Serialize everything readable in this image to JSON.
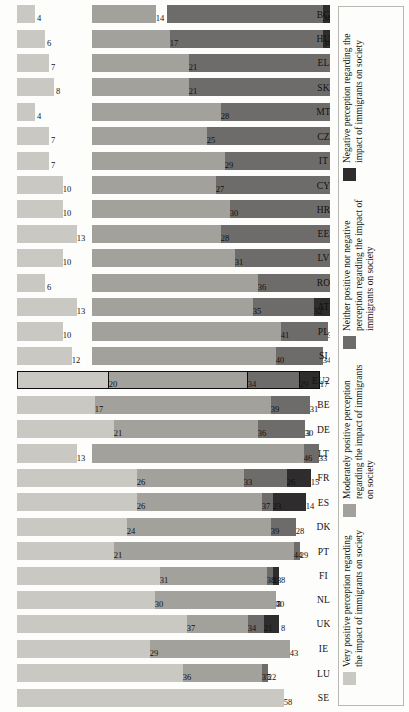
{
  "chart_data": {
    "type": "bar",
    "title": "",
    "subtitle": "",
    "xlabel": "",
    "ylabel": "",
    "orientation": "horizontal-rotated",
    "grid": false,
    "legend_position": "right",
    "ylim": [
      0,
      60
    ],
    "highlight_category": "EU28",
    "categories": [
      "BG",
      "HU",
      "EL",
      "SK",
      "MT",
      "CZ",
      "IT",
      "CY",
      "HR",
      "EE",
      "LV",
      "RO",
      "AT",
      "PL",
      "SI",
      "EU28",
      "BE",
      "DE",
      "LT",
      "FR",
      "ES",
      "DK",
      "PT",
      "FI",
      "NL",
      "UK",
      "IE",
      "LU",
      "SE"
    ],
    "series": [
      {
        "name": "Negative perception regarding the impact of immigrants on society",
        "color": "#2e2c2c",
        "values": [
          48,
          43,
          36,
          30,
          24,
          27,
          27,
          25,
          16,
          19,
          22,
          20,
          20,
          14,
          14,
          17,
          13,
          13,
          8,
          15,
          14,
          9,
          6,
          8,
          7,
          8,
          6,
          5,
          4
        ]
      },
      {
        "name": "Neither positive nor negative perception regarding the impact of immigrants on society",
        "color": "#6e6c6a",
        "values": [
          34,
          34,
          36,
          41,
          44,
          41,
          37,
          38,
          44,
          40,
          37,
          38,
          32,
          35,
          34,
          29,
          31,
          30,
          33,
          26,
          23,
          28,
          29,
          23,
          23,
          21,
          22,
          22,
          11
        ]
      },
      {
        "name": "Moderately positive perception regarding the impact of immigrants on society",
        "color": "#a3a19c",
        "values": [
          14,
          17,
          21,
          21,
          28,
          25,
          29,
          27,
          30,
          28,
          31,
          36,
          35,
          41,
          40,
          34,
          39,
          36,
          46,
          33,
          37,
          39,
          44,
          38,
          40,
          34,
          43,
          37,
          27
        ]
      },
      {
        "name": "Very positive perception regarding the impact of immigrants on society",
        "color": "#c9c8c2",
        "values": [
          4,
          6,
          7,
          8,
          4,
          7,
          7,
          10,
          10,
          13,
          10,
          6,
          13,
          10,
          12,
          20,
          17,
          21,
          13,
          26,
          26,
          24,
          21,
          31,
          30,
          37,
          29,
          36,
          58
        ]
      }
    ]
  },
  "legend": {
    "items": [
      {
        "label": "Negative perception regarding the impact of immigrants on society",
        "color": "#2e2c2c"
      },
      {
        "label": "Neither positive nor negative perception regarding the impact of immigrants on society",
        "color": "#6e6c6a"
      },
      {
        "label": "Moderately positive perception regarding the impact of immigrants on society",
        "color": "#a3a19c"
      },
      {
        "label": "Very positive perception regarding the impact of immigrants on society",
        "color": "#c9c8c2"
      }
    ]
  }
}
